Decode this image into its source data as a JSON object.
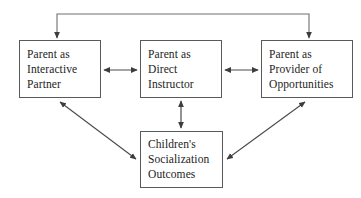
{
  "diagram": {
    "stroke_color": "#4a4a4a",
    "box_border_color": "#5a5a5a",
    "text_color": "#1c1c1c",
    "background_color": "#ffffff",
    "nodes": [
      {
        "id": "interactive-partner",
        "lines": [
          "Parent as",
          "Interactive",
          "Partner"
        ]
      },
      {
        "id": "direct-instructor",
        "lines": [
          "Parent as",
          "Direct",
          "Instructor"
        ]
      },
      {
        "id": "provider-of-opportunities",
        "lines": [
          "Parent as",
          "Provider of",
          "Opportunities"
        ]
      },
      {
        "id": "socialization-outcomes",
        "lines": [
          "Children's",
          "Socialization",
          "Outcomes"
        ]
      }
    ],
    "edges": [
      {
        "id": "top-bracket-to-interactive-partner",
        "from": "top-bracket",
        "to": "interactive-partner",
        "style": "single-arrow-down"
      },
      {
        "id": "top-bracket-to-provider",
        "from": "top-bracket",
        "to": "provider-of-opportunities",
        "style": "single-arrow-down"
      },
      {
        "id": "interactive-partner-direct-instructor",
        "from": "interactive-partner",
        "to": "direct-instructor",
        "style": "double-arrow-horizontal"
      },
      {
        "id": "direct-instructor-provider",
        "from": "direct-instructor",
        "to": "provider-of-opportunities",
        "style": "double-arrow-horizontal"
      },
      {
        "id": "direct-instructor-outcomes",
        "from": "direct-instructor",
        "to": "socialization-outcomes",
        "style": "double-arrow-vertical"
      },
      {
        "id": "interactive-partner-outcomes",
        "from": "interactive-partner",
        "to": "socialization-outcomes",
        "style": "double-arrow-diagonal"
      },
      {
        "id": "provider-outcomes",
        "from": "provider-of-opportunities",
        "to": "socialization-outcomes",
        "style": "double-arrow-diagonal"
      }
    ]
  }
}
